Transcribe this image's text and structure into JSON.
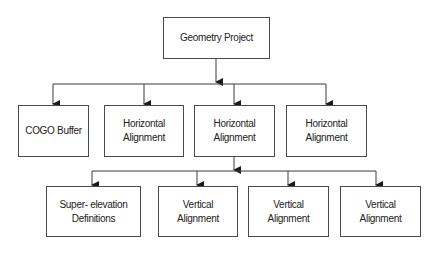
{
  "diagram": {
    "type": "hierarchy",
    "root": {
      "label": "Geometry Project"
    },
    "level1": [
      {
        "label": "COGO Buffer"
      },
      {
        "label": "Horizontal\nAlignment"
      },
      {
        "label": "Horizontal\nAlignment"
      },
      {
        "label": "Horizontal\nAlignment"
      }
    ],
    "level2_parent_index": 2,
    "level2": [
      {
        "label": "Super- elevation\nDefinitions"
      },
      {
        "label": "Vertical\nAlignment"
      },
      {
        "label": "Vertical\nAlignment"
      },
      {
        "label": "Vertical\nAlignment"
      }
    ],
    "colors": {
      "line": "#3a3a3a",
      "border": "#4a4a4a",
      "text": "#222222",
      "background": "#ffffff"
    }
  }
}
